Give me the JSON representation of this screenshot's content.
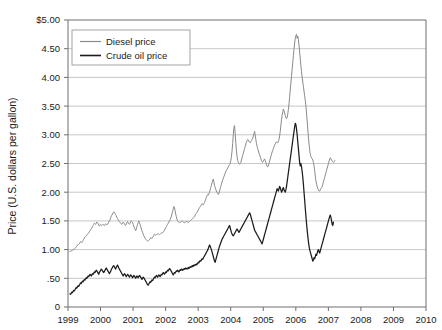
{
  "chart_data": {
    "type": "line",
    "title": "",
    "xlabel": "",
    "ylabel": "Price (U.S. dollars per gallon)",
    "ylim": [
      0,
      5
    ],
    "xlim": [
      1999,
      2010
    ],
    "grid": true,
    "legend_position": "top-left",
    "y_ticks": [
      "0",
      ".50",
      "1.00",
      "1.50",
      "2.00",
      "2.50",
      "3.00",
      "3.50",
      "4.00",
      "4.50",
      "$5.00"
    ],
    "y_tick_values": [
      0,
      0.5,
      1.0,
      1.5,
      2.0,
      2.5,
      3.0,
      3.5,
      4.0,
      4.5,
      5.0
    ],
    "x_ticks": [
      "1999",
      "2000",
      "2001",
      "2002",
      "2003",
      "2004",
      "2005",
      "2006",
      "2007",
      "2008",
      "2009",
      "2010"
    ],
    "x_tick_values": [
      1999,
      2000,
      2001,
      2002,
      2003,
      2004,
      2005,
      2006,
      2007,
      2008,
      2009,
      2010
    ],
    "series": [
      {
        "name": "Diesel price",
        "color": "#8a8a8a",
        "x_start": 1999.06,
        "x_step": 0.019230769,
        "values": [
          0.97,
          0.97,
          0.98,
          0.98,
          0.99,
          1.0,
          1.0,
          1.01,
          1.02,
          1.03,
          1.05,
          1.06,
          1.08,
          1.09,
          1.09,
          1.1,
          1.12,
          1.14,
          1.13,
          1.12,
          1.14,
          1.16,
          1.18,
          1.2,
          1.22,
          1.23,
          1.24,
          1.25,
          1.27,
          1.28,
          1.29,
          1.31,
          1.33,
          1.35,
          1.36,
          1.38,
          1.4,
          1.42,
          1.44,
          1.46,
          1.45,
          1.44,
          1.46,
          1.48,
          1.47,
          1.45,
          1.43,
          1.41,
          1.42,
          1.44,
          1.43,
          1.42,
          1.43,
          1.44,
          1.43,
          1.42,
          1.43,
          1.45,
          1.44,
          1.43,
          1.44,
          1.46,
          1.48,
          1.5,
          1.52,
          1.55,
          1.58,
          1.6,
          1.62,
          1.64,
          1.66,
          1.65,
          1.63,
          1.61,
          1.59,
          1.56,
          1.54,
          1.52,
          1.5,
          1.49,
          1.47,
          1.46,
          1.45,
          1.44,
          1.46,
          1.48,
          1.47,
          1.45,
          1.43,
          1.42,
          1.44,
          1.47,
          1.49,
          1.47,
          1.45,
          1.44,
          1.46,
          1.48,
          1.5,
          1.49,
          1.47,
          1.44,
          1.41,
          1.38,
          1.35,
          1.33,
          1.36,
          1.4,
          1.44,
          1.47,
          1.5,
          1.47,
          1.44,
          1.4,
          1.36,
          1.33,
          1.3,
          1.27,
          1.24,
          1.22,
          1.2,
          1.18,
          1.17,
          1.16,
          1.15,
          1.15,
          1.16,
          1.17,
          1.19,
          1.21,
          1.2,
          1.19,
          1.21,
          1.23,
          1.25,
          1.27,
          1.26,
          1.25,
          1.26,
          1.27,
          1.27,
          1.28,
          1.27,
          1.26,
          1.27,
          1.28,
          1.29,
          1.3,
          1.29,
          1.3,
          1.32,
          1.34,
          1.36,
          1.38,
          1.4,
          1.42,
          1.44,
          1.46,
          1.48,
          1.5,
          1.52,
          1.55,
          1.58,
          1.62,
          1.66,
          1.71,
          1.75,
          1.73,
          1.68,
          1.62,
          1.57,
          1.53,
          1.5,
          1.49,
          1.48,
          1.47,
          1.47,
          1.48,
          1.49,
          1.5,
          1.49,
          1.48,
          1.47,
          1.47,
          1.48,
          1.48,
          1.49,
          1.49,
          1.48,
          1.47,
          1.48,
          1.49,
          1.5,
          1.51,
          1.52,
          1.53,
          1.54,
          1.55,
          1.56,
          1.58,
          1.6,
          1.62,
          1.63,
          1.65,
          1.67,
          1.69,
          1.71,
          1.73,
          1.75,
          1.76,
          1.78,
          1.8,
          1.79,
          1.78,
          1.8,
          1.82,
          1.85,
          1.88,
          1.91,
          1.94,
          1.96,
          1.95,
          1.97,
          2.0,
          2.04,
          2.08,
          2.12,
          2.16,
          2.2,
          2.23,
          2.18,
          2.12,
          2.08,
          2.05,
          2.02,
          2.0,
          1.98,
          1.96,
          1.98,
          2.02,
          2.06,
          2.1,
          2.14,
          2.18,
          2.21,
          2.24,
          2.27,
          2.3,
          2.33,
          2.36,
          2.38,
          2.4,
          2.42,
          2.44,
          2.46,
          2.48,
          2.5,
          2.55,
          2.62,
          2.72,
          2.85,
          3.0,
          3.13,
          3.16,
          3.02,
          2.86,
          2.72,
          2.62,
          2.55,
          2.52,
          2.5,
          2.49,
          2.5,
          2.52,
          2.56,
          2.6,
          2.64,
          2.68,
          2.72,
          2.76,
          2.8,
          2.84,
          2.87,
          2.9,
          2.92,
          2.91,
          2.89,
          2.87,
          2.86,
          2.88,
          2.9,
          2.92,
          2.94,
          2.98,
          3.02,
          3.06,
          3.0,
          2.92,
          2.85,
          2.8,
          2.76,
          2.72,
          2.68,
          2.65,
          2.62,
          2.58,
          2.55,
          2.53,
          2.52,
          2.54,
          2.56,
          2.58,
          2.55,
          2.52,
          2.48,
          2.45,
          2.44,
          2.46,
          2.5,
          2.54,
          2.58,
          2.62,
          2.66,
          2.7,
          2.73,
          2.76,
          2.79,
          2.82,
          2.84,
          2.86,
          2.88,
          2.87,
          2.86,
          2.88,
          2.92,
          2.98,
          3.06,
          3.16,
          3.26,
          3.34,
          3.4,
          3.45,
          3.42,
          3.38,
          3.34,
          3.3,
          3.28,
          3.3,
          3.36,
          3.44,
          3.54,
          3.66,
          3.78,
          3.9,
          4.02,
          4.14,
          4.26,
          4.38,
          4.5,
          4.6,
          4.68,
          4.73,
          4.75,
          4.68,
          4.72,
          4.66,
          4.56,
          4.44,
          4.32,
          4.2,
          4.1,
          4.0,
          3.92,
          3.84,
          3.76,
          3.68,
          3.6,
          3.5,
          3.38,
          3.24,
          3.1,
          2.96,
          2.84,
          2.74,
          2.66,
          2.62,
          2.6,
          2.58,
          2.56,
          2.52,
          2.46,
          2.38,
          2.28,
          2.2,
          2.14,
          2.1,
          2.06,
          2.04,
          2.02,
          2.02,
          2.04,
          2.06,
          2.08,
          2.1,
          2.14,
          2.18,
          2.22,
          2.26,
          2.3,
          2.34,
          2.38,
          2.42,
          2.46,
          2.5,
          2.54,
          2.58,
          2.6,
          2.58,
          2.56,
          2.54,
          2.53,
          2.52,
          2.53,
          2.55
        ]
      },
      {
        "name": "Crude oil price",
        "color": "#1c1c1c",
        "x_start": 1999.06,
        "x_step": 0.019230769,
        "values": [
          0.23,
          0.22,
          0.24,
          0.26,
          0.25,
          0.27,
          0.29,
          0.28,
          0.3,
          0.32,
          0.34,
          0.33,
          0.35,
          0.37,
          0.36,
          0.38,
          0.4,
          0.42,
          0.41,
          0.43,
          0.45,
          0.44,
          0.46,
          0.48,
          0.47,
          0.49,
          0.51,
          0.5,
          0.52,
          0.54,
          0.53,
          0.55,
          0.57,
          0.56,
          0.54,
          0.56,
          0.58,
          0.57,
          0.59,
          0.61,
          0.6,
          0.62,
          0.64,
          0.63,
          0.61,
          0.59,
          0.57,
          0.6,
          0.62,
          0.64,
          0.66,
          0.65,
          0.63,
          0.61,
          0.6,
          0.62,
          0.64,
          0.66,
          0.68,
          0.66,
          0.64,
          0.62,
          0.6,
          0.58,
          0.6,
          0.62,
          0.65,
          0.67,
          0.69,
          0.71,
          0.72,
          0.7,
          0.68,
          0.66,
          0.69,
          0.71,
          0.73,
          0.71,
          0.68,
          0.66,
          0.64,
          0.62,
          0.6,
          0.58,
          0.56,
          0.54,
          0.56,
          0.58,
          0.57,
          0.55,
          0.53,
          0.55,
          0.57,
          0.56,
          0.54,
          0.52,
          0.54,
          0.56,
          0.55,
          0.53,
          0.51,
          0.53,
          0.55,
          0.54,
          0.52,
          0.5,
          0.52,
          0.54,
          0.53,
          0.51,
          0.53,
          0.55,
          0.54,
          0.52,
          0.5,
          0.48,
          0.5,
          0.52,
          0.51,
          0.49,
          0.47,
          0.45,
          0.43,
          0.41,
          0.39,
          0.38,
          0.4,
          0.42,
          0.44,
          0.43,
          0.45,
          0.47,
          0.46,
          0.48,
          0.5,
          0.52,
          0.51,
          0.53,
          0.55,
          0.54,
          0.52,
          0.54,
          0.56,
          0.55,
          0.53,
          0.55,
          0.57,
          0.56,
          0.58,
          0.6,
          0.59,
          0.57,
          0.59,
          0.61,
          0.6,
          0.62,
          0.64,
          0.63,
          0.65,
          0.67,
          0.66,
          0.64,
          0.62,
          0.6,
          0.58,
          0.56,
          0.58,
          0.6,
          0.59,
          0.61,
          0.63,
          0.62,
          0.64,
          0.63,
          0.61,
          0.63,
          0.65,
          0.64,
          0.66,
          0.65,
          0.64,
          0.66,
          0.65,
          0.67,
          0.66,
          0.68,
          0.67,
          0.66,
          0.68,
          0.67,
          0.69,
          0.68,
          0.7,
          0.69,
          0.71,
          0.7,
          0.72,
          0.71,
          0.73,
          0.72,
          0.74,
          0.73,
          0.75,
          0.74,
          0.76,
          0.78,
          0.77,
          0.79,
          0.81,
          0.8,
          0.82,
          0.84,
          0.83,
          0.85,
          0.87,
          0.89,
          0.91,
          0.93,
          0.95,
          0.97,
          0.99,
          1.02,
          1.05,
          1.08,
          1.06,
          1.03,
          1.0,
          0.96,
          0.92,
          0.88,
          0.84,
          0.8,
          0.78,
          0.82,
          0.86,
          0.9,
          0.94,
          0.98,
          1.02,
          1.06,
          1.09,
          1.12,
          1.15,
          1.18,
          1.2,
          1.22,
          1.24,
          1.26,
          1.28,
          1.3,
          1.32,
          1.34,
          1.36,
          1.38,
          1.4,
          1.42,
          1.38,
          1.34,
          1.3,
          1.27,
          1.25,
          1.24,
          1.26,
          1.28,
          1.3,
          1.32,
          1.34,
          1.36,
          1.34,
          1.32,
          1.3,
          1.32,
          1.34,
          1.36,
          1.38,
          1.4,
          1.42,
          1.44,
          1.46,
          1.48,
          1.5,
          1.52,
          1.54,
          1.56,
          1.58,
          1.6,
          1.62,
          1.64,
          1.62,
          1.58,
          1.54,
          1.5,
          1.46,
          1.42,
          1.38,
          1.34,
          1.32,
          1.3,
          1.28,
          1.26,
          1.24,
          1.22,
          1.2,
          1.18,
          1.16,
          1.14,
          1.12,
          1.1,
          1.14,
          1.18,
          1.22,
          1.26,
          1.3,
          1.34,
          1.38,
          1.42,
          1.46,
          1.5,
          1.54,
          1.58,
          1.62,
          1.66,
          1.7,
          1.74,
          1.78,
          1.82,
          1.86,
          1.9,
          1.94,
          1.98,
          2.02,
          2.06,
          2.04,
          2.02,
          2.06,
          2.1,
          2.08,
          2.04,
          2.0,
          2.02,
          2.06,
          2.08,
          2.04,
          2.02,
          2.0,
          2.04,
          2.1,
          2.18,
          2.26,
          2.34,
          2.42,
          2.5,
          2.58,
          2.66,
          2.74,
          2.82,
          2.9,
          2.98,
          3.06,
          3.14,
          3.2,
          3.18,
          3.1,
          3.0,
          2.88,
          2.76,
          2.64,
          2.52,
          2.46,
          2.5,
          2.44,
          2.36,
          2.26,
          2.14,
          2.0,
          1.86,
          1.72,
          1.58,
          1.46,
          1.34,
          1.24,
          1.14,
          1.06,
          1.0,
          0.96,
          0.92,
          0.88,
          0.84,
          0.8,
          0.82,
          0.86,
          0.84,
          0.88,
          0.92,
          0.9,
          0.94,
          0.98,
          1.0,
          0.96,
          0.94,
          0.98,
          1.02,
          1.06,
          1.1,
          1.14,
          1.18,
          1.22,
          1.26,
          1.3,
          1.34,
          1.38,
          1.42,
          1.46,
          1.5,
          1.54,
          1.58,
          1.6,
          1.56,
          1.5,
          1.44,
          1.42,
          1.48
        ]
      }
    ]
  },
  "legend": {
    "items": [
      {
        "label": "Diesel price"
      },
      {
        "label": "Crude oil price"
      }
    ]
  },
  "axes": {
    "y_title": "Price (U.S. dollars per gallon)"
  }
}
